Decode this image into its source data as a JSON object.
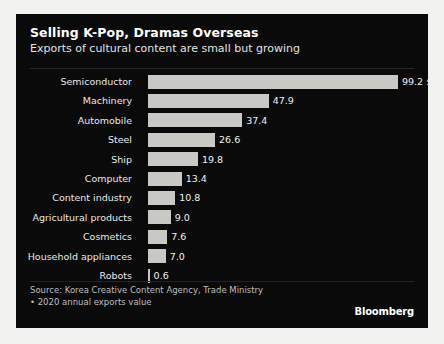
{
  "header": {
    "title": "Selling K-Pop, Dramas Overseas",
    "subtitle": "Exports of cultural content are small but growing"
  },
  "footer": {
    "source": "Source: Korea Creative Content Agency, Trade Ministry",
    "note": "• 2020 annual exports value",
    "brand": "Bloomberg"
  },
  "colors": {
    "panel_background": "#0a0a0a",
    "bar": "#c8c8c4",
    "title_text": "#ffffff",
    "label_text": "#e8e8e8",
    "footer_text": "#bdbdbd"
  },
  "chart_data": {
    "type": "bar",
    "orientation": "horizontal",
    "title": "Selling K-Pop, Dramas Overseas",
    "subtitle": "Exports of cultural content are small but growing",
    "xlabel": "",
    "ylabel": "",
    "unit": "$B",
    "xlim": [
      0,
      99.2
    ],
    "grid": false,
    "legend": false,
    "categories": [
      "Semiconductor",
      "Machinery",
      "Automobile",
      "Steel",
      "Ship",
      "Computer",
      "Content industry",
      "Agricultural products",
      "Cosmetics",
      "Household appliances",
      "Robots"
    ],
    "values": [
      99.2,
      47.9,
      37.4,
      26.6,
      19.8,
      13.4,
      10.8,
      9.0,
      7.6,
      7.0,
      0.6
    ],
    "value_labels": [
      "99.2 $B",
      "47.9",
      "37.4",
      "26.6",
      "19.8",
      "13.4",
      "10.8",
      "9.0",
      "7.6",
      "7.0",
      "0.6"
    ]
  }
}
